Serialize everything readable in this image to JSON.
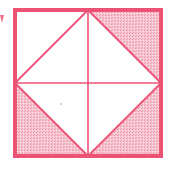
{
  "diagram": {
    "type": "geometric-figure",
    "colors": {
      "stroke": "#ec5274",
      "shade": "#f6c6d2",
      "shade_dot": "#ee8fa6",
      "background": "#ffffff"
    },
    "square": {
      "x": 15,
      "y": 10,
      "size": 146,
      "border_width": 4
    },
    "center": {
      "x": 88,
      "y": 83
    },
    "lines": [
      {
        "name": "vertical-midline",
        "from": "top-mid",
        "to": "bottom-mid"
      },
      {
        "name": "horizontal-midline",
        "from": "left-mid",
        "to": "right-mid"
      },
      {
        "name": "diamond-top-left-edge",
        "from": "left-mid",
        "to": "top-mid"
      },
      {
        "name": "diamond-top-right-edge",
        "from": "top-mid",
        "to": "right-mid"
      },
      {
        "name": "diamond-bottom-right-edge",
        "from": "right-mid",
        "to": "bottom-mid"
      },
      {
        "name": "diamond-bottom-left-edge",
        "from": "bottom-mid",
        "to": "left-mid"
      }
    ],
    "regions": {
      "top_left_corner": "unshaded",
      "top_right_corner": "shaded",
      "bottom_left_corner": "shaded",
      "bottom_right_corner": "shaded",
      "diamond_interior": "unshaded"
    },
    "shaded_fraction_label": "3 of 4 corner triangles shaded"
  }
}
